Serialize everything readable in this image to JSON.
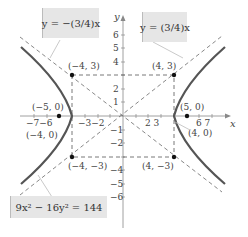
{
  "diagram": {
    "type": "hyperbola",
    "equation": "9x² − 16y² = 144",
    "asymptotes": [
      "y = −(3/4)x",
      "y = (3/4)x"
    ],
    "axis_labels": {
      "x": "x",
      "y": "y"
    },
    "x_ticks_left": "−7−6",
    "x_ticks_left2": "−3−2",
    "x_ticks_right": "2  3",
    "x_ticks_right2": "6  7",
    "y_ticks": [
      "6",
      "5",
      "4",
      "2",
      "1",
      "−1",
      "−2",
      "−4",
      "−5",
      "−6"
    ],
    "points": [
      {
        "label": "(−4, 3)",
        "x": -4,
        "y": 3
      },
      {
        "label": "(4, 3)",
        "x": 4,
        "y": 3
      },
      {
        "label": "(−5, 0)",
        "x": -5,
        "y": 0
      },
      {
        "label": "(5, 0)",
        "x": 5,
        "y": 0
      },
      {
        "label": "(−4, 0)",
        "x": -4,
        "y": 0
      },
      {
        "label": "(4, 0)",
        "x": 4,
        "y": 0
      },
      {
        "label": "(−4, −3)",
        "x": -4,
        "y": -3
      },
      {
        "label": "(4, −3)",
        "x": 4,
        "y": -3
      }
    ],
    "colors": {
      "curve": "#555555",
      "box": "#e6e6e6",
      "dashed": "#555555"
    }
  }
}
